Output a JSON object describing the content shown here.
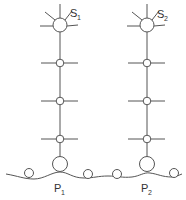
{
  "diagram": {
    "type": "schematic",
    "colors": {
      "line": "#555555",
      "background": "#ffffff",
      "text": "#333333"
    },
    "columns": [
      {
        "id": "col1",
        "top_label": {
          "main": "S",
          "sub": "1"
        },
        "bottom_label": {
          "main": "P",
          "sub": "1"
        }
      },
      {
        "id": "col2",
        "top_label": {
          "main": "S",
          "sub": "2"
        },
        "bottom_label": {
          "main": "P",
          "sub": "2"
        }
      }
    ],
    "intermediate_nodes_per_column": 3,
    "ground_small_circles": 4
  }
}
